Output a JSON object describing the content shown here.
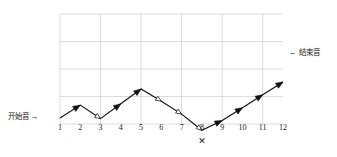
{
  "figure": {
    "title": "",
    "start_label": "开始音 →",
    "end_label": "← 结束音",
    "cross_mark": "✕",
    "cross_at_tick": 8,
    "grid_color": "#cfcfcf",
    "line_color": "#111111",
    "background": "#ffffff"
  },
  "chart_data": {
    "type": "line",
    "title": "",
    "xlabel": "",
    "ylabel": "",
    "categories": [
      "1",
      "2",
      "3",
      "4",
      "5",
      "6",
      "7",
      "8",
      "9",
      "10",
      "11",
      "12"
    ],
    "x": [
      1,
      2,
      3,
      4,
      5,
      6,
      7,
      8,
      9,
      10,
      11,
      12
    ],
    "values": [
      3,
      5,
      2.9,
      5.2,
      7.5,
      5.6,
      3.6,
      1.1,
      2.6,
      4.6,
      6.6,
      8.6
    ],
    "xlim": [
      0.6,
      12.6
    ],
    "ylim": [
      0,
      13
    ],
    "grid": true,
    "legend": false,
    "series": [
      {
        "name": "melodic-contour",
        "values": [
          3,
          5,
          2.9,
          5.2,
          7.5,
          5.6,
          3.6,
          1.1,
          2.6,
          4.6,
          6.6,
          8.6
        ]
      }
    ],
    "segments": [
      {
        "from": 1,
        "to": 2,
        "direction": "up",
        "arrow": "solid"
      },
      {
        "from": 2,
        "to": 3,
        "direction": "down",
        "arrow": "hollow"
      },
      {
        "from": 3,
        "to": 4,
        "direction": "up",
        "arrow": "solid"
      },
      {
        "from": 4,
        "to": 5,
        "direction": "up",
        "arrow": "solid"
      },
      {
        "from": 5,
        "to": 6,
        "direction": "down",
        "arrow": "hollow"
      },
      {
        "from": 6,
        "to": 7,
        "direction": "down",
        "arrow": "hollow"
      },
      {
        "from": 7,
        "to": 8,
        "direction": "down",
        "arrow": "hollow"
      },
      {
        "from": 8,
        "to": 9,
        "direction": "up",
        "arrow": "solid"
      },
      {
        "from": 9,
        "to": 10,
        "direction": "up",
        "arrow": "solid"
      },
      {
        "from": 10,
        "to": 11,
        "direction": "up",
        "arrow": "solid"
      },
      {
        "from": 11,
        "to": 12,
        "direction": "up",
        "arrow": "solid"
      }
    ],
    "annotations": [
      {
        "text": "开始音 →",
        "at_tick": 1,
        "position": "left"
      },
      {
        "text": "← 结束音",
        "at_tick": 12,
        "position": "right"
      },
      {
        "text": "✕",
        "at_tick": 8,
        "position": "below-axis"
      }
    ]
  }
}
